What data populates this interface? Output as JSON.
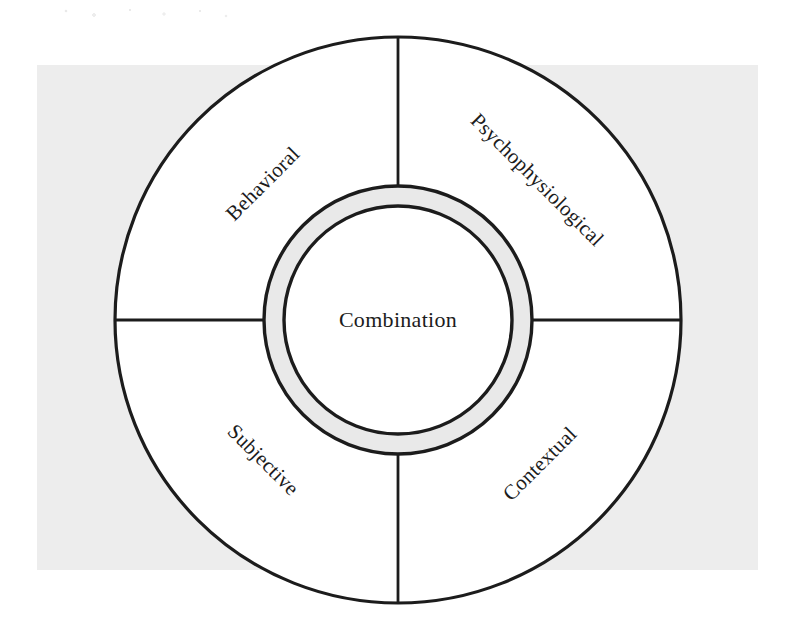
{
  "figure": {
    "title_center": "Combination",
    "sectors": [
      {
        "id": "behavioral",
        "label": "Behavioral",
        "position": "top-left",
        "rotation_deg": -45,
        "cx": 263,
        "cy": 184
      },
      {
        "id": "psychophysiological",
        "label": "Psychophysiological",
        "position": "top-right",
        "rotation_deg": 45,
        "cx": 537,
        "cy": 180
      },
      {
        "id": "subjective",
        "label": "Subjective",
        "position": "bottom-left",
        "rotation_deg": 45,
        "cx": 263,
        "cy": 460
      },
      {
        "id": "contextual",
        "label": "Contextual",
        "position": "bottom-right",
        "rotation_deg": -45,
        "cx": 540,
        "cy": 464
      }
    ],
    "geometry": {
      "center_x": 398,
      "center_y": 320,
      "outer_radius": 283,
      "ring_outer_radius": 134,
      "ring_inner_radius": 114,
      "divider_angles_deg": [
        0,
        90,
        180,
        270
      ]
    },
    "colors": {
      "stroke": "#1c1c1c",
      "sector_fill": "#ffffff",
      "ring_band_fill": "#e9e9e9",
      "core_fill": "#ffffff",
      "page_tint": "#ededed"
    }
  }
}
